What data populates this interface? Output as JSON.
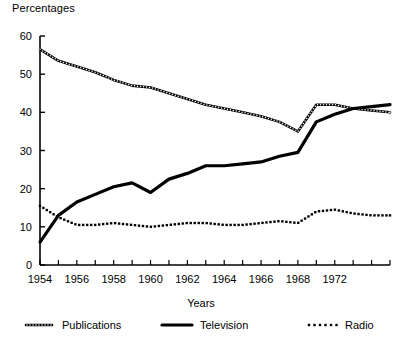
{
  "axes": {
    "y_title": "Percentages",
    "x_title": "Years"
  },
  "legend": {
    "items": [
      {
        "key": "publications",
        "label": "Publications",
        "style": "beaded-line",
        "color": "#000000"
      },
      {
        "key": "television",
        "label": "Television",
        "style": "solid-thick-line",
        "color": "#000000"
      },
      {
        "key": "radio",
        "label": "Radio",
        "style": "dotted-line",
        "color": "#000000"
      }
    ]
  },
  "chart_data": {
    "type": "line",
    "title": "",
    "subtitle": "",
    "xlabel": "Years",
    "ylabel": "Percentages",
    "xlim": [
      1954,
      1973
    ],
    "ylim": [
      0,
      60
    ],
    "grid": false,
    "legend_position": "bottom",
    "ytick_labels": [
      "0",
      "10",
      "20",
      "30",
      "40",
      "50",
      "60"
    ],
    "yticks": [
      0,
      10,
      20,
      30,
      40,
      50,
      60
    ],
    "xtick_labels": [
      "1954",
      "1956",
      "1958",
      "1960",
      "1962",
      "1964",
      "1966",
      "1968",
      "1972"
    ],
    "xticks_major": [
      1954,
      1956,
      1958,
      1960,
      1962,
      1964,
      1966,
      1968,
      1970
    ],
    "xticks_minor": [
      1954,
      1955,
      1956,
      1957,
      1958,
      1959,
      1960,
      1961,
      1962,
      1963,
      1964,
      1965,
      1966,
      1967,
      1968,
      1969,
      1970,
      1971,
      1972,
      1973
    ],
    "x": [
      1954,
      1955,
      1956,
      1957,
      1958,
      1959,
      1960,
      1961,
      1962,
      1963,
      1964,
      1965,
      1966,
      1967,
      1968,
      1969,
      1970,
      1971,
      1972,
      1973
    ],
    "series": [
      {
        "name": "Publications",
        "style": "beaded-line",
        "values": [
          56.5,
          53.5,
          52.0,
          50.5,
          48.5,
          47.0,
          46.5,
          45.0,
          43.5,
          42.0,
          41.0,
          40.0,
          39.0,
          37.5,
          35.0,
          42.0,
          42.0,
          41.0,
          40.5,
          40.0
        ]
      },
      {
        "name": "Television",
        "style": "solid-thick-line",
        "values": [
          6.0,
          13.0,
          16.5,
          18.5,
          20.5,
          21.5,
          19.0,
          22.5,
          24.0,
          26.0,
          26.0,
          26.5,
          27.0,
          28.5,
          29.5,
          37.5,
          39.5,
          41.0,
          41.5,
          42.0
        ]
      },
      {
        "name": "Radio",
        "style": "dotted-line",
        "values": [
          15.5,
          12.5,
          10.5,
          10.5,
          11.0,
          10.5,
          10.0,
          10.5,
          11.0,
          11.0,
          10.5,
          10.5,
          11.0,
          11.5,
          11.0,
          14.0,
          14.5,
          13.5,
          13.0,
          13.0
        ]
      }
    ]
  }
}
